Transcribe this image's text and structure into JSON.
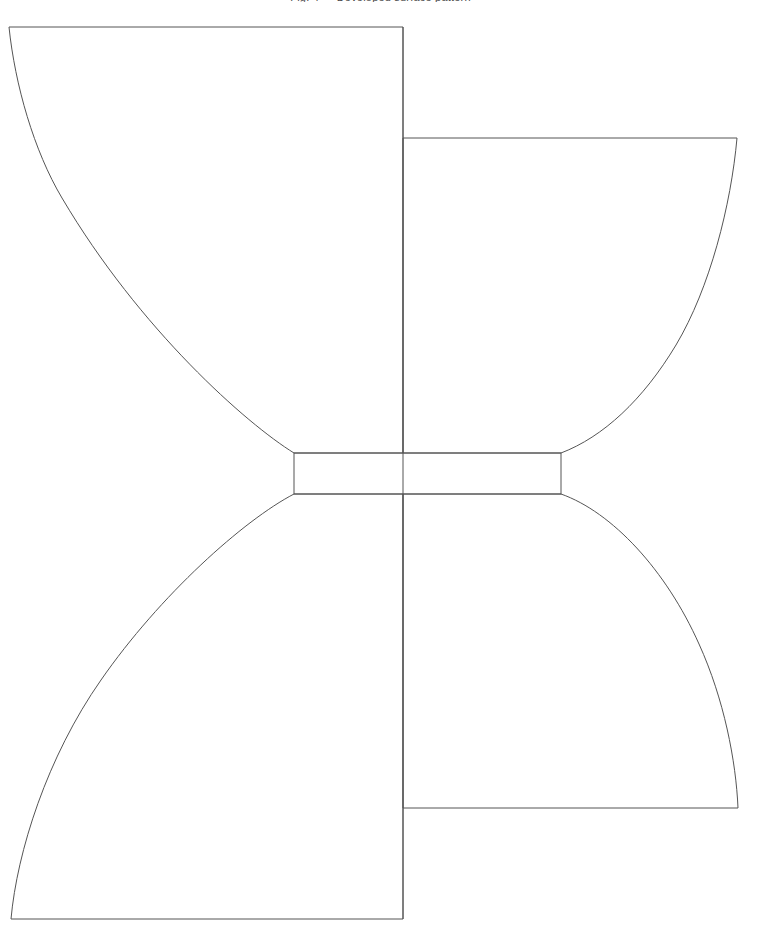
{
  "canvas": {
    "width": 761,
    "height": 941,
    "background_color": "#ffffff"
  },
  "caption": {
    "text": "Fig. 4 — Developed surface pattern",
    "visible_fragment_only": true
  },
  "style": {
    "stroke_color": "#555555",
    "stroke_width": 1,
    "fill": "none",
    "accent_color": "#555555"
  },
  "figure": {
    "elements": [
      {
        "name": "upper-left-panel",
        "kind": "closed-path",
        "vertices": [
          {
            "x": 9,
            "y": 27
          },
          {
            "x": 403,
            "y": 27
          },
          {
            "x": 403,
            "y": 453
          },
          {
            "x": 294,
            "y": 453
          }
        ],
        "curve": "concave arc from (9,27) sweeping down-right to (294,453)"
      },
      {
        "name": "upper-right-panel",
        "kind": "closed-path",
        "vertices": [
          {
            "x": 403,
            "y": 138
          },
          {
            "x": 737,
            "y": 138
          },
          {
            "x": 561,
            "y": 453
          },
          {
            "x": 403,
            "y": 453
          }
        ],
        "curve": "concave arc from (737,138) sweeping down-left to (561,453)"
      },
      {
        "name": "center-neck-rectangle",
        "kind": "rectangle",
        "x": 294,
        "y": 453,
        "width": 267,
        "height": 41
      },
      {
        "name": "lower-left-panel",
        "kind": "closed-path",
        "vertices": [
          {
            "x": 294,
            "y": 494
          },
          {
            "x": 403,
            "y": 494
          },
          {
            "x": 403,
            "y": 919
          },
          {
            "x": 11,
            "y": 919
          }
        ],
        "curve": "convex arc from (294,494) sweeping down-left to (11,919)"
      },
      {
        "name": "lower-right-panel",
        "kind": "closed-path",
        "vertices": [
          {
            "x": 403,
            "y": 494
          },
          {
            "x": 561,
            "y": 494
          },
          {
            "x": 738,
            "y": 808
          },
          {
            "x": 403,
            "y": 808
          }
        ],
        "curve": "convex arc from (561,494) sweeping down-right to (738,808)"
      },
      {
        "name": "vertical-center-divider",
        "kind": "line",
        "x1": 403,
        "y1": 27,
        "x2": 403,
        "y2": 919
      }
    ]
  }
}
